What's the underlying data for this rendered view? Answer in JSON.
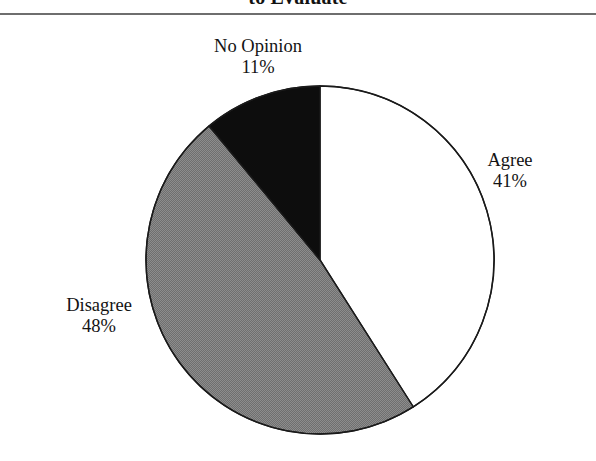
{
  "page": {
    "width": 596,
    "height": 461,
    "background": "#ffffff"
  },
  "title": {
    "text": "to Evaluate",
    "note": "cropped at top edge"
  },
  "divider": {
    "color": "#6e6e6e"
  },
  "chart_data": {
    "type": "pie",
    "title": "to Evaluate",
    "xlabel": "",
    "ylabel": "",
    "grid": false,
    "legend": "none",
    "labels_position": "outside-callout",
    "start_angle_deg": 0,
    "direction": "clockwise",
    "categories": [
      "Agree",
      "Disagree",
      "No Opinion"
    ],
    "values": [
      41,
      48,
      11
    ],
    "value_suffix": "%",
    "slices": [
      {
        "name": "Agree",
        "value": 41,
        "value_label": "41%",
        "fill": "#ffffff",
        "stroke": "#1a1a1a",
        "start_deg": 0,
        "end_deg": 147.6
      },
      {
        "name": "Disagree",
        "value": 48,
        "value_label": "48%",
        "fill": "#7a7a7a",
        "stroke": "#1a1a1a",
        "start_deg": 147.6,
        "end_deg": 320.4
      },
      {
        "name": "No Opinion",
        "value": 11,
        "value_label": "11%",
        "fill": "#0d0d0d",
        "stroke": "#1a1a1a",
        "start_deg": 320.4,
        "end_deg": 360
      }
    ],
    "geometry": {
      "center_x": 320,
      "center_y": 260,
      "radius": 174
    }
  },
  "labels": {
    "no_opinion": {
      "name": "No Opinion",
      "value": "11%"
    },
    "agree": {
      "name": "Agree",
      "value": "41%"
    },
    "disagree": {
      "name": "Disagree",
      "value": "48%"
    }
  }
}
